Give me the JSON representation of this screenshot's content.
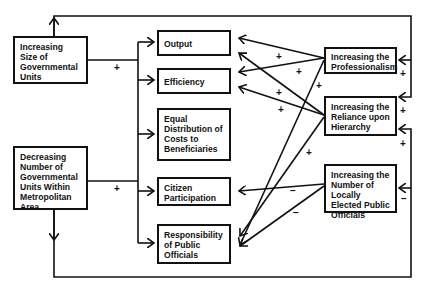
{
  "diagram": {
    "type": "causal-loop",
    "boxes": {
      "size": {
        "label": "Increasing Size of Governmental Units"
      },
      "number": {
        "label": "Decreasing Number of Governmental Units Within Metropolitan Area"
      },
      "output": {
        "label": "Output"
      },
      "efficiency": {
        "label": "Efficiency"
      },
      "equal": {
        "label": "Equal Distribution of Costs to Beneficiaries"
      },
      "citizen": {
        "label": "Citizen Participation"
      },
      "responsibility": {
        "label": "Responsibility of Public Officials"
      },
      "professionalism": {
        "label": "Increasing the Professionalism"
      },
      "hierarchy": {
        "label": "Increasing the Reliance upon Hierarchy"
      },
      "elected": {
        "label": "Increasing the Number of Locally Elected Public Officials"
      }
    },
    "signs": {
      "size_to_outcomes": "+",
      "number_to_outcomes": "+",
      "prof_to_output": "+",
      "prof_to_efficiency": "+",
      "prof_to_responsibility": "+",
      "hier_to_output": "+",
      "hier_to_efficiency": "+",
      "hier_to_responsibility": "+",
      "elected_to_citizen": "−",
      "elected_to_responsibility": "−",
      "loop_to_prof": "+",
      "loop_to_hier_top": "+",
      "loop_to_hier_bottom": "+",
      "loop_to_elected": "−"
    },
    "edges": [
      {
        "from": "size",
        "to": [
          "output",
          "efficiency",
          "equal",
          "citizen",
          "responsibility"
        ],
        "sign": "+"
      },
      {
        "from": "number",
        "to": [
          "output",
          "efficiency",
          "equal",
          "citizen",
          "responsibility"
        ],
        "sign": "+"
      },
      {
        "from": "size",
        "to": [
          "professionalism",
          "hierarchy"
        ],
        "sign": "+",
        "via": "top loop"
      },
      {
        "from": "number",
        "to": [
          "hierarchy",
          "elected"
        ],
        "sign": "+ / −",
        "via": "bottom loop"
      },
      {
        "from": "professionalism",
        "to": [
          "output",
          "efficiency",
          "responsibility"
        ],
        "sign": "+"
      },
      {
        "from": "hierarchy",
        "to": [
          "output",
          "efficiency",
          "responsibility"
        ],
        "sign": "+"
      },
      {
        "from": "elected",
        "to": [
          "citizen",
          "responsibility"
        ],
        "sign": "−"
      }
    ]
  }
}
